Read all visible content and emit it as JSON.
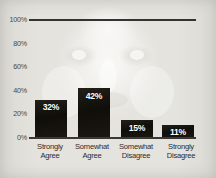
{
  "chart_data": {
    "type": "bar",
    "title": "",
    "subtitle": "",
    "xlabel": "",
    "ylabel": "",
    "categories": [
      "Strongly\nAgree",
      "Somewhat\nAgree",
      "Somewhat\nDisagree",
      "Strongly\nDisagree"
    ],
    "values": [
      32,
      42,
      15,
      11
    ],
    "value_labels": [
      "32%",
      "42%",
      "15%",
      "11%"
    ],
    "ylim": [
      0,
      100
    ],
    "yticks": [
      0,
      20,
      40,
      60,
      80,
      100
    ],
    "ytick_labels": [
      "0%",
      "20%",
      "40%",
      "60%",
      "80%",
      "100%"
    ],
    "grid": false,
    "legend": false,
    "legend_position": "none",
    "annotations": [
      "horizontal rule drawn at 100%",
      "faint grayscale portrait watermark behind plot"
    ],
    "colors": {
      "bar": "#17150f",
      "value_text": "#ffffff",
      "axis_text": "#4a4843",
      "category_text": "#2e2c28",
      "rule": "#35332f",
      "background": "#e4e3de"
    }
  }
}
